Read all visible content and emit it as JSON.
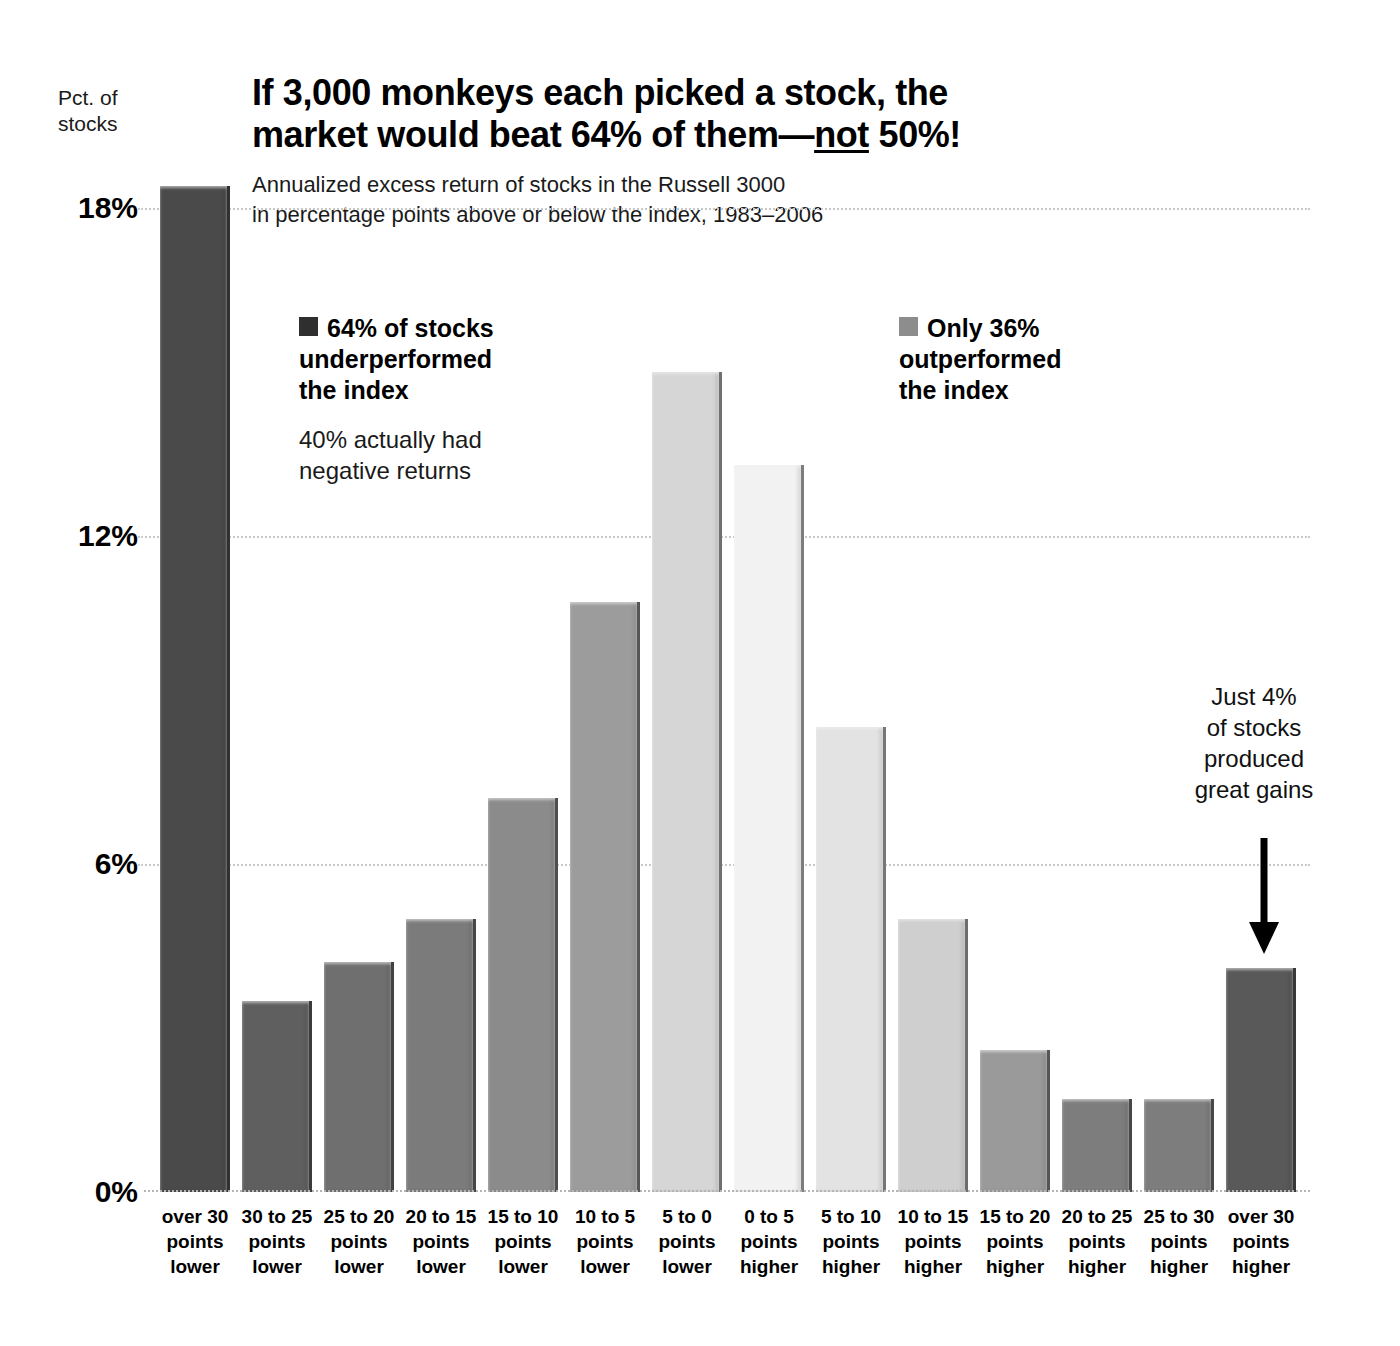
{
  "axis": {
    "y_caption": "Pct. of\nstocks",
    "y_caption_line1": "Pct. of",
    "y_caption_line2": "stocks"
  },
  "header": {
    "title_line1": "If 3,000 monkeys each picked a stock, the",
    "title_line2_a": "market would beat 64% of them—",
    "title_line2_underlined": "not",
    "title_line2_b": " 50%!",
    "subtitle_line1": "Annualized excess return of stocks in the Russell 3000",
    "subtitle_line2": "in percentage points above or below the index, 1983–2006"
  },
  "legend": {
    "left": {
      "swatch_color": "#2f2f2f",
      "line1": "64% of stocks",
      "line2": "underperformed",
      "line3": "the index",
      "sub_line1": "40% actually had",
      "sub_line2": "negative returns"
    },
    "right": {
      "swatch_color": "#8d8d8d",
      "line1": "Only 36%",
      "line2": "outperformed",
      "line3": "the index"
    }
  },
  "annotation": {
    "line1": "Just 4%",
    "line2": "of stocks",
    "line3": "produced",
    "line4": "great gains",
    "arrow_icon": "down-arrow-icon"
  },
  "chart_data": {
    "type": "bar",
    "title": "If 3,000 monkeys each picked a stock, the market would beat 64% of them—not 50%!",
    "subtitle": "Annualized excess return of stocks in the Russell 3000 in percentage points above or below the index, 1983–2006",
    "xlabel": "",
    "ylabel": "Pct. of stocks",
    "ylim": [
      0,
      18
    ],
    "yticks": [
      0,
      6,
      12,
      18
    ],
    "ytick_labels": [
      "0%",
      "6%",
      "12%",
      "18%"
    ],
    "grid": true,
    "legend_position": "inside-top",
    "categories": [
      "over 30 points lower",
      "30 to 25 points lower",
      "25 to 20 points lower",
      "20 to 15 points lower",
      "15 to 10 points lower",
      "10 to 5 points lower",
      "5 to 0 points lower",
      "0 to 5 points higher",
      "5 to 10 points higher",
      "10 to 15 points higher",
      "15 to 20 points higher",
      "20 to 25 points higher",
      "25 to 30 points higher",
      "over 30 points higher"
    ],
    "category_lines": [
      [
        "over 30",
        "points",
        "lower"
      ],
      [
        "30 to 25",
        "points",
        "lower"
      ],
      [
        "25 to 20",
        "points",
        "lower"
      ],
      [
        "20 to 15",
        "points",
        "lower"
      ],
      [
        "15 to 10",
        "points",
        "lower"
      ],
      [
        "10 to 5",
        "points",
        "lower"
      ],
      [
        "5 to 0",
        "points",
        "lower"
      ],
      [
        "0 to 5",
        "points",
        "higher"
      ],
      [
        "5 to 10",
        "points",
        "higher"
      ],
      [
        "10 to 15",
        "points",
        "higher"
      ],
      [
        "15 to 20",
        "points",
        "higher"
      ],
      [
        "20 to 25",
        "points",
        "higher"
      ],
      [
        "25 to 30",
        "points",
        "higher"
      ],
      [
        "over 30",
        "points",
        "higher"
      ]
    ],
    "values": [
      18.4,
      3.5,
      4.2,
      5.0,
      7.2,
      10.8,
      15.0,
      13.3,
      8.5,
      5.0,
      2.6,
      1.7,
      1.7,
      4.1
    ],
    "bar_colors": [
      "#4a4a4a",
      "#5f5f5f",
      "#6f6f6f",
      "#7b7b7b",
      "#8b8b8b",
      "#9c9c9c",
      "#d6d6d6",
      "#f2f2f2",
      "#e3e3e3",
      "#cfcfcf",
      "#9a9a9a",
      "#7d7d7d",
      "#7d7d7d",
      "#595959"
    ]
  }
}
